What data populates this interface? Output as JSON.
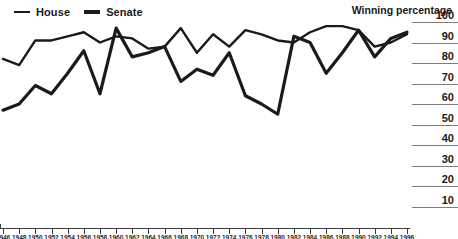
{
  "legend": {
    "items": [
      {
        "label": "House",
        "key": "house",
        "color": "#1a1a1a"
      },
      {
        "label": "Senate",
        "key": "senate",
        "color": "#1a1a1a"
      }
    ]
  },
  "axis_title": "Winning percentage",
  "chart_data": {
    "type": "line",
    "title": "Winning percentage",
    "xlabel": "",
    "ylabel": "Winning percentage",
    "ylim": [
      0,
      100
    ],
    "yticks": [
      10,
      20,
      30,
      40,
      50,
      60,
      70,
      80,
      90,
      100
    ],
    "grid": false,
    "legend_position": "top-left",
    "x": [
      1946,
      1948,
      1950,
      1952,
      1954,
      1956,
      1958,
      1960,
      1962,
      1964,
      1966,
      1968,
      1970,
      1972,
      1974,
      1976,
      1978,
      1980,
      1982,
      1984,
      1986,
      1988,
      1990,
      1992,
      1994,
      1996
    ],
    "categories": [
      "1946",
      "1948",
      "1950",
      "1952",
      "1954",
      "1956",
      "1958",
      "1960",
      "1962",
      "1964",
      "1966",
      "1968",
      "1970",
      "1972",
      "1974",
      "1976",
      "1978",
      "1980",
      "1982",
      "1984",
      "1986",
      "1988",
      "1990",
      "1992",
      "1994",
      "1996"
    ],
    "series": [
      {
        "name": "House",
        "color": "#1a1a1a",
        "values": [
          82,
          79,
          91,
          91,
          93,
          95,
          90,
          93,
          92,
          87,
          88,
          97,
          85,
          94,
          88,
          96,
          94,
          91,
          90,
          95,
          98,
          98,
          96,
          88,
          90,
          94
        ]
      },
      {
        "name": "Senate",
        "color": "#1a1a1a",
        "values": [
          57,
          60,
          69,
          65,
          75,
          86,
          65,
          97,
          83,
          85,
          88,
          71,
          77,
          74,
          85,
          64,
          60,
          55,
          93,
          90,
          75,
          85,
          96,
          83,
          92,
          95
        ]
      }
    ]
  }
}
